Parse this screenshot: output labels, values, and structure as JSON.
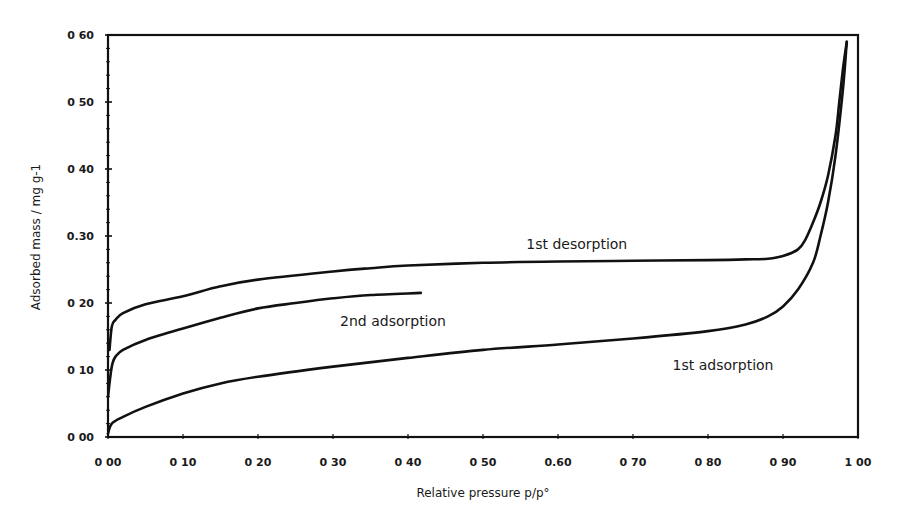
{
  "chart_data": {
    "type": "line",
    "title": "",
    "xlabel": "Relative pressure p/p°",
    "ylabel": "Adsorbed mass / mg g-1",
    "xlim": [
      0,
      1.0
    ],
    "ylim": [
      0,
      0.6
    ],
    "grid": false,
    "legend": "none (curves labelled inline)",
    "x_ticks": [
      "0 00",
      "0 10",
      "0 20",
      "0 30",
      "0 40",
      "0 50",
      "0.60",
      "0 70",
      "0 80",
      "0 90",
      "1 00"
    ],
    "y_ticks": [
      "0 00",
      "0 10",
      "0 20",
      "0.30",
      "0 40",
      "0 50",
      "0 60"
    ],
    "series": [
      {
        "name": "1st adsorption",
        "label_pos": [
          0.82,
          0.1
        ],
        "x": [
          0.0,
          0.005,
          0.02,
          0.05,
          0.1,
          0.15,
          0.2,
          0.3,
          0.4,
          0.5,
          0.6,
          0.7,
          0.8,
          0.85,
          0.88,
          0.9,
          0.92,
          0.94,
          0.95,
          0.96,
          0.97,
          0.98,
          0.985
        ],
        "values": [
          0.005,
          0.02,
          0.03,
          0.045,
          0.065,
          0.08,
          0.09,
          0.105,
          0.118,
          0.13,
          0.138,
          0.147,
          0.158,
          0.168,
          0.18,
          0.195,
          0.22,
          0.26,
          0.3,
          0.35,
          0.42,
          0.52,
          0.59
        ]
      },
      {
        "name": "1st desorption",
        "label_pos": [
          0.625,
          0.28
        ],
        "x": [
          0.985,
          0.98,
          0.975,
          0.97,
          0.96,
          0.95,
          0.94,
          0.93,
          0.92,
          0.9,
          0.88,
          0.85,
          0.8,
          0.7,
          0.6,
          0.5,
          0.4,
          0.35,
          0.3,
          0.2,
          0.15,
          0.1,
          0.05,
          0.02,
          0.01,
          0.005,
          0.002
        ],
        "values": [
          0.59,
          0.55,
          0.5,
          0.45,
          0.39,
          0.35,
          0.32,
          0.295,
          0.28,
          0.27,
          0.266,
          0.265,
          0.264,
          0.263,
          0.262,
          0.26,
          0.256,
          0.252,
          0.247,
          0.235,
          0.225,
          0.21,
          0.198,
          0.185,
          0.175,
          0.165,
          0.13
        ]
      },
      {
        "name": "2nd adsorption",
        "label_pos": [
          0.38,
          0.165
        ],
        "x": [
          0.0,
          0.003,
          0.006,
          0.01,
          0.02,
          0.05,
          0.1,
          0.15,
          0.2,
          0.25,
          0.3,
          0.35,
          0.417
        ],
        "values": [
          0.06,
          0.09,
          0.11,
          0.12,
          0.13,
          0.145,
          0.162,
          0.178,
          0.192,
          0.2,
          0.207,
          0.212,
          0.215
        ]
      }
    ]
  }
}
